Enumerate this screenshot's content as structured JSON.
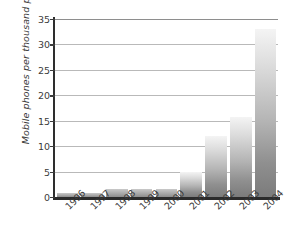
{
  "chart_data": {
    "type": "bar",
    "title": "",
    "xlabel": "",
    "ylabel": "Mobile phones per thousand people",
    "categories": [
      "1996",
      "1997",
      "1998",
      "1999",
      "2000",
      "2001",
      "2002",
      "2003",
      "2004"
    ],
    "values": [
      0.7,
      0.7,
      1.6,
      1.6,
      1.6,
      5.0,
      12.0,
      15.8,
      33.0
    ],
    "ylim": [
      0,
      35
    ],
    "yticks": [
      0,
      5,
      10,
      15,
      20,
      25,
      30,
      35
    ],
    "ytick_labels": [
      "0",
      "5",
      "10",
      "15",
      "20",
      "25",
      "30",
      "35"
    ],
    "grid": true,
    "legend": false,
    "bar_color_top": "#f4f4f4",
    "bar_color_bottom": "#7b7b7b",
    "axis_color": "#2b2b2b",
    "gridline_color": "#b9b9b9"
  }
}
